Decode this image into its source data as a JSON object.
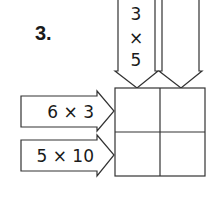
{
  "problem": {
    "number": "3."
  },
  "arrows": {
    "top_left": {
      "line1": "3",
      "line2": "×",
      "line3": "5"
    },
    "top_right": {
      "text": ""
    },
    "left_top": {
      "text": "6 × 3"
    },
    "left_bottom": {
      "text": "5 × 10"
    }
  },
  "grid": {
    "rows": 2,
    "cols": 2,
    "cells": [
      "",
      "",
      "",
      ""
    ]
  },
  "colors": {
    "stroke": "#333333",
    "text": "#1a1a1a",
    "background": "#ffffff"
  }
}
